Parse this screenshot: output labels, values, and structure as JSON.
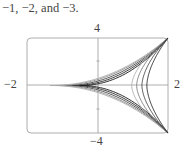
{
  "caption": "−1, −2, and −3.",
  "chart_data": {
    "type": "line",
    "title": "",
    "xlim": [
      -2,
      2
    ],
    "ylim": [
      -4,
      4
    ],
    "x_tick_labels": [
      "−2",
      "2"
    ],
    "y_tick_labels": [
      "4",
      "−4"
    ],
    "grid": false,
    "series": [
      {
        "name": "loop-1",
        "kind": "left-loop",
        "tip_x": -0.49,
        "color": "#111111"
      },
      {
        "name": "loop-2",
        "kind": "left-loop",
        "tip_x": -0.71,
        "color": "#222222"
      },
      {
        "name": "loop-3",
        "kind": "left-loop",
        "tip_x": -0.94,
        "color": "#444444"
      },
      {
        "name": "loop-4",
        "kind": "left-loop",
        "tip_x": -1.17,
        "color": "#888888"
      },
      {
        "name": "loop-5",
        "kind": "left-loop",
        "tip_x": -1.34,
        "color": "#aaaaaa"
      },
      {
        "name": "branch-1",
        "kind": "right-branch",
        "axis_x": 0.97,
        "color": "#aaaaaa"
      },
      {
        "name": "branch-2",
        "kind": "right-branch",
        "axis_x": 1.11,
        "color": "#777777"
      },
      {
        "name": "branch-3",
        "kind": "right-branch",
        "axis_x": 1.26,
        "color": "#444444"
      },
      {
        "name": "branch-4",
        "kind": "right-branch",
        "axis_x": 1.4,
        "color": "#222222"
      }
    ]
  },
  "labels": {
    "y_top": "4",
    "y_bottom": "−4",
    "x_left": "−2",
    "x_right": "2"
  }
}
